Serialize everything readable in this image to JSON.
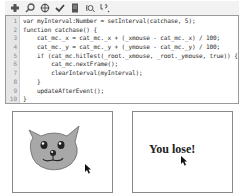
{
  "toolbar": {
    "buttons": [
      {
        "name": "add-statement",
        "icon": "plus-icon"
      },
      {
        "name": "find",
        "icon": "search-icon"
      },
      {
        "name": "target-path",
        "icon": "target-icon"
      },
      {
        "name": "check-syntax",
        "icon": "check-icon"
      },
      {
        "name": "auto-format",
        "icon": "format-icon"
      },
      {
        "name": "insert-target",
        "icon": "debug-icon"
      },
      {
        "name": "show-code-hint",
        "icon": "code-hint-icon"
      }
    ]
  },
  "code": {
    "lines": [
      {
        "num": "1",
        "text": "var myInterval:Number = setInterval(catchase, 5);"
      },
      {
        "num": "2",
        "text": "function catchase() {"
      },
      {
        "num": "3",
        "text": "    cat_mc._x = cat_mc._x + (_xmouse - cat_mc._x) / 100;"
      },
      {
        "num": "4",
        "text": "    cat_mc._y = cat_mc._y + (_ymouse - cat_mc._y) / 100;"
      },
      {
        "num": "5",
        "text": "    if (cat_mc.hitTest(_root._xmouse, _root._ymouse, true)) {"
      },
      {
        "num": "6",
        "text": "        cat_mc.nextFrame();"
      },
      {
        "num": "7",
        "text": "        clearInterval(myInterval);"
      },
      {
        "num": "8",
        "text": "    }"
      },
      {
        "num": "9",
        "text": "    updateAfterEvent();"
      },
      {
        "num": "10",
        "text": "}"
      }
    ]
  },
  "frames": {
    "left": {
      "content": "cat-face",
      "cat_color": "#a8a8a8"
    },
    "right": {
      "message": "You lose!"
    }
  },
  "colors": {
    "gutter_bg": "#e6e6e6",
    "border": "#9a9a9a",
    "code_text": "#2b2b2b"
  }
}
